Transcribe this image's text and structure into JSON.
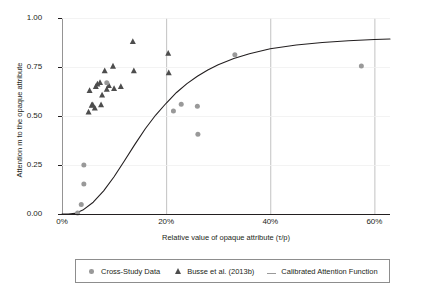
{
  "chart_data": {
    "type": "scatter",
    "title": "",
    "xlabel": "Relative value of opaque attribute (τ/p)",
    "ylabel": "Attention m to the opaque attribute",
    "xlim": [
      0,
      0.63
    ],
    "ylim": [
      0,
      1.0
    ],
    "grid": true,
    "legend_position": "bottom",
    "x_ticks": [
      {
        "value": 0,
        "label": "0%"
      },
      {
        "value": 0.2,
        "label": "20%"
      },
      {
        "value": 0.4,
        "label": "40%"
      },
      {
        "value": 0.6,
        "label": "60%"
      }
    ],
    "y_ticks": [
      {
        "value": 0.0,
        "label": "0.00"
      },
      {
        "value": 0.25,
        "label": "0.25"
      },
      {
        "value": 0.5,
        "label": "0.50"
      },
      {
        "value": 0.75,
        "label": "0.75"
      },
      {
        "value": 1.0,
        "label": "1.00"
      }
    ],
    "series": [
      {
        "name": "Cross-Study Data",
        "marker": "circle",
        "color": "#999999",
        "points": [
          [
            0.03,
            0.005
          ],
          [
            0.037,
            0.048
          ],
          [
            0.042,
            0.25
          ],
          [
            0.042,
            0.153
          ],
          [
            0.086,
            0.67
          ],
          [
            0.214,
            0.525
          ],
          [
            0.229,
            0.56
          ],
          [
            0.26,
            0.55
          ],
          [
            0.261,
            0.407
          ],
          [
            0.332,
            0.812
          ],
          [
            0.575,
            0.755
          ]
        ]
      },
      {
        "name": "Busse et al. (2013b)",
        "marker": "triangle",
        "color": "#4d4d4d",
        "points": [
          [
            0.051,
            0.52
          ],
          [
            0.053,
            0.63
          ],
          [
            0.057,
            0.555
          ],
          [
            0.059,
            0.557
          ],
          [
            0.063,
            0.54
          ],
          [
            0.065,
            0.65
          ],
          [
            0.068,
            0.663
          ],
          [
            0.073,
            0.671
          ],
          [
            0.075,
            0.557
          ],
          [
            0.077,
            0.607
          ],
          [
            0.082,
            0.73
          ],
          [
            0.086,
            0.636
          ],
          [
            0.09,
            0.655
          ],
          [
            0.098,
            0.754
          ],
          [
            0.1,
            0.64
          ],
          [
            0.113,
            0.65
          ],
          [
            0.136,
            0.88
          ],
          [
            0.138,
            0.73
          ],
          [
            0.204,
            0.82
          ],
          [
            0.205,
            0.72
          ]
        ]
      },
      {
        "name": "Calibrated Attention Function",
        "marker": "line",
        "color": "#231f20",
        "description": "Smooth S-shaped calibrated attention curve rising from 0.00 at 0% to about 0.88 at 60%",
        "points": [
          [
            0.0,
            0.0
          ],
          [
            0.012,
            0.0
          ],
          [
            0.025,
            0.003
          ],
          [
            0.04,
            0.02
          ],
          [
            0.06,
            0.06
          ],
          [
            0.08,
            0.118
          ],
          [
            0.1,
            0.19
          ],
          [
            0.12,
            0.272
          ],
          [
            0.14,
            0.355
          ],
          [
            0.16,
            0.435
          ],
          [
            0.18,
            0.505
          ],
          [
            0.2,
            0.565
          ],
          [
            0.22,
            0.62
          ],
          [
            0.24,
            0.665
          ],
          [
            0.26,
            0.703
          ],
          [
            0.28,
            0.735
          ],
          [
            0.3,
            0.762
          ],
          [
            0.33,
            0.793
          ],
          [
            0.36,
            0.818
          ],
          [
            0.4,
            0.843
          ],
          [
            0.45,
            0.862
          ],
          [
            0.5,
            0.875
          ],
          [
            0.55,
            0.884
          ],
          [
            0.6,
            0.89
          ],
          [
            0.63,
            0.893
          ]
        ]
      }
    ],
    "legend": [
      {
        "label": "Cross-Study Data",
        "glyph": "circle"
      },
      {
        "label": "Busse et al. (2013b)",
        "glyph": "triangle"
      },
      {
        "label": "Calibrated Attention Function",
        "glyph": "line"
      }
    ]
  },
  "style": {
    "marker_circle_color": "#999999",
    "marker_triangle_color": "#4d4d4d",
    "curve_color": "#231f20",
    "gridline_color": "#b3b3b3",
    "axis_color": "#231f20",
    "legend_border_color": "#8d8d8d",
    "background": "#ffffff"
  }
}
